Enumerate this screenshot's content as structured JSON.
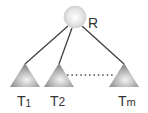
{
  "diagram": {
    "type": "tree",
    "root": {
      "label": "R"
    },
    "subtrees": [
      {
        "label": "T",
        "subscript": "1"
      },
      {
        "label": "T",
        "subscript": "2"
      },
      {
        "label": "T",
        "subscript": "m"
      }
    ],
    "ellipsis_between": [
      "T2",
      "Tm"
    ],
    "colors": {
      "edge": "#404040",
      "node_fill_light": "#ffffff",
      "node_fill_dark": "#bdbdbd",
      "triangle_light": "#f2f2f2",
      "triangle_dark": "#8c8c8c",
      "label": "#333333"
    }
  }
}
